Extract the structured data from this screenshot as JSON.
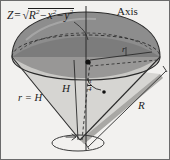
{
  "figure": {
    "background_color": "#f2f1ef",
    "ink_color": "#1c1c1c",
    "labels": {
      "formula_lhs": "Z",
      "formula_equals": "=",
      "formula_radicand_r": "R",
      "formula_exp_2a": "2",
      "formula_minus_1": "−",
      "formula_x": "x",
      "formula_exp_2b": "2",
      "formula_minus_2": "−",
      "formula_y": "y",
      "formula_exp_2c": "2",
      "axis": "Axis",
      "cone_slant_relation": "r = H",
      "height": "H",
      "radius_big": "R",
      "radius_small": "r",
      "angle_numerator": "π",
      "angle_denominator": "4"
    },
    "icons": {
      "rotation_arrow": "rotation-arrow-icon",
      "center_point": "center-point-dot",
      "vertex_point": "angle-vertex-dot"
    },
    "colors": {
      "dome_top": "#8f8f8f",
      "dome_shadow": "#6e6e6e",
      "cone_left": "#d9d8d5",
      "cone_right": "#b6b5b2",
      "outline": "#2a2a2a",
      "dashed": "#2a2a2a"
    }
  }
}
